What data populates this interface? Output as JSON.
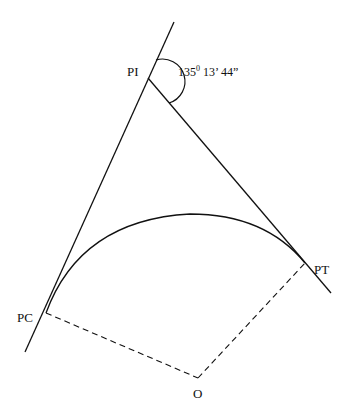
{
  "diagram": {
    "type": "horizontal-curve",
    "labels": {
      "pi": "PI",
      "pc": "PC",
      "pt": "PT",
      "center": "O"
    },
    "angle": {
      "degrees": "135",
      "degree_symbol": "0",
      "minutes": " 13’",
      "seconds": " 44”"
    },
    "colors": {
      "line": "#111111",
      "background": "#ffffff"
    }
  }
}
